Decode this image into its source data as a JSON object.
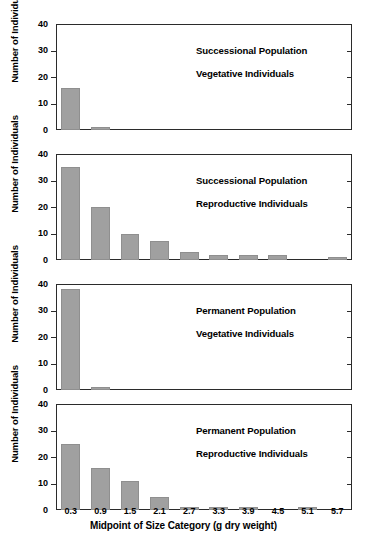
{
  "figure": {
    "y_axis_title": "Number of Individuals",
    "x_axis_title": "Midpoint of Size Category (g dry weight)",
    "y_ticks": [
      0,
      10,
      20,
      30,
      40
    ],
    "y_limit": [
      0,
      40
    ],
    "x_tick_labels": [
      "0.3",
      "0.9",
      "1.5",
      "2.1",
      "2.7",
      "3.3",
      "3.9",
      "4.5",
      "5.1",
      "5.7"
    ],
    "bar_color": "#a0a0a0",
    "axis_color": "#2b2b2b"
  },
  "chart_data": {
    "type": "bar",
    "title": "",
    "xlabel": "Midpoint of Size Category (g dry weight)",
    "ylabel": "Number of Individuals",
    "ylim": [
      0,
      40
    ],
    "yticks": [
      0,
      10,
      20,
      30,
      40
    ],
    "grid": false,
    "legend": "none",
    "categories": [
      "0.3",
      "0.9",
      "1.5",
      "2.1",
      "2.7",
      "3.3",
      "3.9",
      "4.5",
      "5.1",
      "5.7"
    ],
    "panels": [
      {
        "index": 0,
        "annotation_line1": "Successional Population",
        "annotation_line2": "Vegetative Individuals",
        "values": [
          16,
          1,
          0,
          0,
          0,
          0,
          0,
          0,
          0,
          0
        ]
      },
      {
        "index": 1,
        "annotation_line1": "Successional Population",
        "annotation_line2": "Reproductive Individuals",
        "values": [
          35,
          20,
          10,
          7,
          3,
          2,
          2,
          2,
          0,
          1
        ]
      },
      {
        "index": 2,
        "annotation_line1": "Permanent Population",
        "annotation_line2": "Vegetative Individuals",
        "values": [
          38,
          1,
          0,
          0,
          0,
          0,
          0,
          0,
          0,
          0
        ]
      },
      {
        "index": 3,
        "annotation_line1": "Permanent Population",
        "annotation_line2": "Reproductive Individuals",
        "values": [
          25,
          16,
          11,
          5,
          1,
          1,
          1,
          0,
          1,
          0
        ]
      }
    ]
  }
}
